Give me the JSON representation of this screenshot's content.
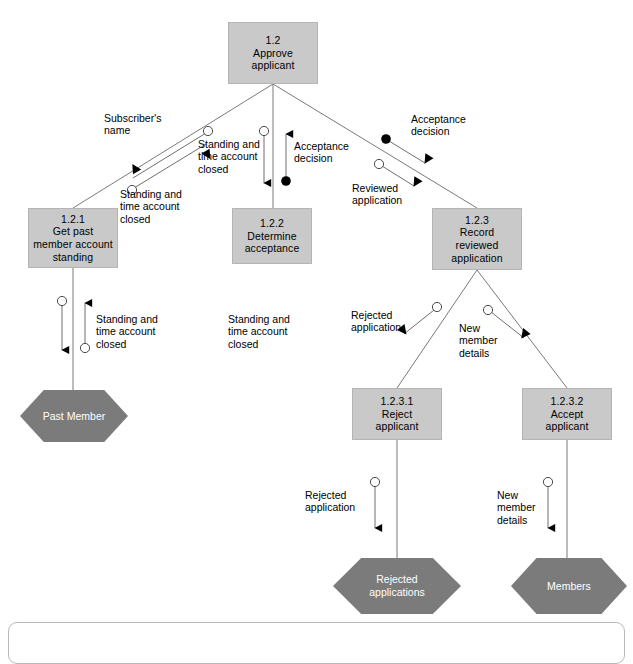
{
  "diagram": {
    "type": "structure-chart",
    "colors": {
      "module_fill": "#c9c9c9",
      "module_border": "#b4b4b4",
      "datastore_fill": "#7b7b7b",
      "datastore_text": "#ffffff",
      "line": "#7a7a7a",
      "text": "#000000",
      "background": "#ffffff"
    },
    "modules": [
      {
        "id": "1.2",
        "name": "Approve\napplicant"
      },
      {
        "id": "1.2.1",
        "name": "Get past\nmember account\nstanding"
      },
      {
        "id": "1.2.2",
        "name": "Determine\nacceptance"
      },
      {
        "id": "1.2.3",
        "name": "Record\nreviewed\napplication"
      },
      {
        "id": "1.2.3.1",
        "name": "Reject\napplicant"
      },
      {
        "id": "1.2.3.2",
        "name": "Accept\napplicant"
      }
    ],
    "datastores": [
      {
        "name": "Past Member"
      },
      {
        "name": "Rejected\napplications"
      },
      {
        "name": "Members"
      }
    ],
    "couples": [
      {
        "label": "Subscriber's\nname",
        "kind": "data",
        "direction": "down"
      },
      {
        "label": "Standing and\ntime account\nclosed",
        "kind": "data",
        "direction": "up"
      },
      {
        "label": "Standing and\ntime account\nclosed",
        "kind": "data",
        "direction": "down"
      },
      {
        "label": "Acceptance\ndecision",
        "kind": "control",
        "direction": "up"
      },
      {
        "label": "Acceptance\ndecision",
        "kind": "control",
        "direction": "down"
      },
      {
        "label": "Reviewed\napplication",
        "kind": "data",
        "direction": "down"
      },
      {
        "label": "Standing and\ntime account\nclosed",
        "kind": "data",
        "direction": "down"
      },
      {
        "label": "Rejected\napplication",
        "kind": "data",
        "direction": "down"
      },
      {
        "label": "New\nmember\ndetails",
        "kind": "data",
        "direction": "down"
      },
      {
        "label": "Rejected\napplication",
        "kind": "data",
        "direction": "down"
      },
      {
        "label": "New\nmember\ndetails",
        "kind": "data",
        "direction": "down"
      }
    ],
    "edge_labels": {
      "subscribers_name": "Subscriber's\nname",
      "standing_closed_upper": "Standing and\ntime account\nclosed",
      "standing_closed_left": "Standing and\ntime account\nclosed",
      "acceptance_decision_center": "Acceptance\ndecision",
      "acceptance_decision_right": "Acceptance\ndecision",
      "reviewed_application": "Reviewed\napplication",
      "standing_closed_store": "Standing and\ntime account\nclosed",
      "standing_closed_mid": "Standing and\ntime account\nclosed",
      "rejected_application_upper": "Rejected\napplication",
      "new_member_details_upper": "New\nmember\ndetails",
      "rejected_application_lower": "Rejected\napplication",
      "new_member_details_lower": "New\nmember\ndetails"
    }
  }
}
